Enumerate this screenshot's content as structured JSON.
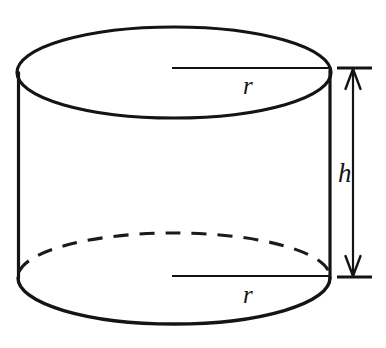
{
  "figure": {
    "name": "cylinder-diagram",
    "background_color": "#ffffff",
    "stroke_color": "#141414"
  },
  "labels": {
    "radius_top": "r",
    "radius_bottom": "r",
    "height": "h"
  },
  "geometry": {
    "center_x": 174,
    "top_ellipse": {
      "cy": 72.5,
      "rx": 157,
      "ry": 45.5
    },
    "bottom_ellipse": {
      "cy": 278,
      "rx": 156,
      "ry": 46
    },
    "left_wall_x": 18,
    "right_wall_x": 330,
    "top_radius_line_y": 68,
    "bottom_radius_line_y": 276,
    "dimension_arrow_x": 353,
    "dimension_tick_top_y": 68,
    "dimension_tick_bottom_y": 277
  },
  "elements": {
    "top_ellipse_name": "cylinder-top-ellipse",
    "bottom_front_arc_name": "cylinder-bottom-front-arc",
    "bottom_back_arc_name": "cylinder-bottom-hidden-arc-dashed",
    "left_wall_name": "cylinder-left-wall",
    "right_wall_name": "cylinder-right-wall",
    "top_radius_line_name": "radius-line-top",
    "bottom_radius_line_name": "radius-line-bottom",
    "height_dimension_name": "height-dimension-arrow"
  }
}
